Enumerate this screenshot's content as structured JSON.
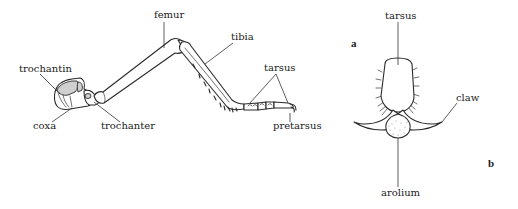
{
  "figure": {
    "panels": [
      {
        "id": "a",
        "letter": "a",
        "subject": "insect leg (lateral view)",
        "labels": {
          "femur": "femur",
          "tibia": "tibia",
          "trochantin": "trochantin",
          "coxa": "coxa",
          "trochanter": "trochanter",
          "tarsus": "tarsus",
          "pretarsus": "pretarsus"
        }
      },
      {
        "id": "b",
        "letter": "b",
        "subject": "distal tarsus and pretarsus (enlarged)",
        "labels": {
          "tarsus": "tarsus",
          "claw": "claw",
          "arolium": "arolium"
        }
      }
    ]
  }
}
